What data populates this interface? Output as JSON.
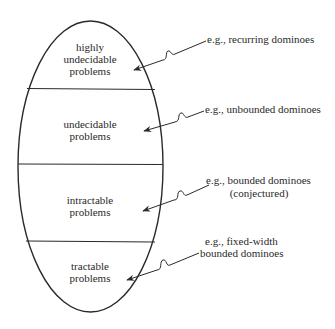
{
  "diagram": {
    "type": "nested-classification-oval",
    "regions": [
      {
        "lines": [
          "highly",
          "undecidable",
          "problems"
        ],
        "example": [
          "e.g., recurring dominoes"
        ]
      },
      {
        "lines": [
          "undecidable",
          "problems"
        ],
        "example": [
          "e.g., unbounded dominoes"
        ]
      },
      {
        "lines": [
          "intractable",
          "problems"
        ],
        "example": [
          "e.g., bounded dominoes",
          "(conjectured)"
        ]
      },
      {
        "lines": [
          "tractable",
          "problems"
        ],
        "example": [
          "e.g., fixed-width",
          "bounded dominoes"
        ]
      }
    ],
    "colors": {
      "stroke": "#2a2a2a",
      "background": "#ffffff"
    }
  }
}
